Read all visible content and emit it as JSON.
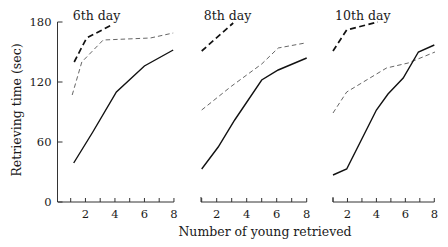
{
  "chart_data": {
    "type": "line",
    "xlabel": "Number of young retrieved",
    "ylabel": "Retrieving time (sec)",
    "ylim": [
      0,
      180
    ],
    "yticks": [
      0,
      60,
      120,
      180
    ],
    "xlim": [
      1,
      8
    ],
    "xticks_minor": [
      1,
      2,
      3,
      4,
      5,
      6,
      7,
      8
    ],
    "xtick_labels": [
      "2",
      "4",
      "6",
      "8"
    ],
    "grid": false,
    "legend": "none",
    "panels": [
      {
        "title": "6th day",
        "series": [
          {
            "name": "thick-dashed",
            "style": "thick-dash",
            "points": [
              [
                1.24,
                140
              ],
              [
                2.08,
                164
              ],
              [
                3.78,
                177
              ]
            ]
          },
          {
            "name": "thin-dashed",
            "style": "thin-dash",
            "points": [
              [
                1.1,
                107
              ],
              [
                1.75,
                140
              ],
              [
                3.2,
                162
              ],
              [
                6.4,
                164
              ],
              [
                7.95,
                169
              ]
            ]
          },
          {
            "name": "solid",
            "style": "solid",
            "points": [
              [
                1.2,
                39
              ],
              [
                2.5,
                70
              ],
              [
                4.1,
                110
              ],
              [
                6.0,
                136
              ],
              [
                7.95,
                152
              ]
            ]
          }
        ]
      },
      {
        "title": "8th day",
        "series": [
          {
            "name": "thick-dashed",
            "style": "thick-dash",
            "points": [
              [
                1.0,
                151
              ],
              [
                3.1,
                179
              ]
            ]
          },
          {
            "name": "thin-dashed",
            "style": "thin-dash",
            "points": [
              [
                1.0,
                92
              ],
              [
                3.0,
                116
              ],
              [
                5.0,
                138
              ],
              [
                6.1,
                154
              ],
              [
                7.9,
                159
              ]
            ]
          },
          {
            "name": "solid",
            "style": "solid",
            "points": [
              [
                1.0,
                33
              ],
              [
                2.1,
                55
              ],
              [
                3.2,
                82
              ],
              [
                5.0,
                122
              ],
              [
                6.1,
                132
              ],
              [
                8.0,
                144
              ]
            ]
          }
        ]
      },
      {
        "title": "10th day",
        "series": [
          {
            "name": "thick-dashed",
            "style": "thick-dash",
            "points": [
              [
                1.0,
                151
              ],
              [
                1.95,
                172
              ],
              [
                4.1,
                180
              ]
            ]
          },
          {
            "name": "thin-dashed",
            "style": "thin-dash",
            "points": [
              [
                1.0,
                89
              ],
              [
                1.95,
                110
              ],
              [
                4.7,
                134
              ],
              [
                6.2,
                139
              ],
              [
                8.05,
                150
              ]
            ]
          },
          {
            "name": "solid",
            "style": "solid",
            "points": [
              [
                1.0,
                27
              ],
              [
                1.95,
                33
              ],
              [
                4.0,
                92
              ],
              [
                4.8,
                108
              ],
              [
                5.85,
                124
              ],
              [
                6.9,
                150
              ],
              [
                8.0,
                157
              ]
            ]
          }
        ]
      }
    ]
  },
  "layout": {
    "y_zero_px": 202,
    "px_per_unit_y": 1.0,
    "y_axis_x_px": 57.5,
    "panels_px": [
      {
        "x1": 70.7,
        "step": 14.75,
        "axis_start": 58
      },
      {
        "x1": 201.7,
        "step": 15.0,
        "axis_start": 201
      },
      {
        "x1": 333.0,
        "step": 14.47,
        "axis_start": 333
      }
    ]
  }
}
